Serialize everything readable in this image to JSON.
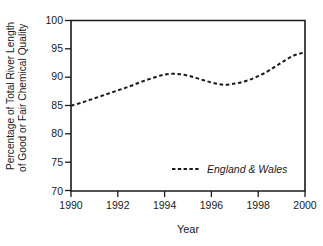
{
  "chart_data": {
    "type": "line",
    "title": "",
    "xlabel": "Year",
    "ylabel_line1": "Percentage of Total River Length",
    "ylabel_line2": "of Good or Fair Chemical Quality",
    "xlim": [
      1990,
      2000
    ],
    "ylim": [
      70,
      100
    ],
    "xticks": [
      1990,
      1992,
      1994,
      1996,
      1998,
      2000
    ],
    "xtick_labels": [
      "1990",
      "1992",
      "1994",
      "1996",
      "1998",
      "2000"
    ],
    "yticks": [
      70,
      75,
      80,
      85,
      90,
      95,
      100
    ],
    "ytick_labels": [
      "70",
      "75",
      "80",
      "85",
      "90",
      "95",
      "100"
    ],
    "grid": false,
    "legend_position": "inside-lower-right",
    "line_color": "#1a1a1a",
    "line_style": "dashed",
    "series": [
      {
        "name": "England & Wales",
        "x": [
          1990,
          1990.5,
          1991,
          1991.5,
          1992,
          1992.5,
          1993,
          1993.5,
          1994,
          1994.5,
          1995,
          1995.5,
          1996,
          1996.5,
          1997,
          1997.5,
          1998,
          1998.5,
          1999,
          1999.5,
          2000
        ],
        "values": [
          85.0,
          85.6,
          86.3,
          87.0,
          87.7,
          88.4,
          89.2,
          89.9,
          90.5,
          90.6,
          90.3,
          89.7,
          89.1,
          88.7,
          88.9,
          89.4,
          90.2,
          91.3,
          92.6,
          93.8,
          94.4
        ]
      }
    ]
  },
  "legend": {
    "entries": [
      {
        "label": "England & Wales",
        "swatch": "dashed-line-swatch"
      }
    ]
  }
}
